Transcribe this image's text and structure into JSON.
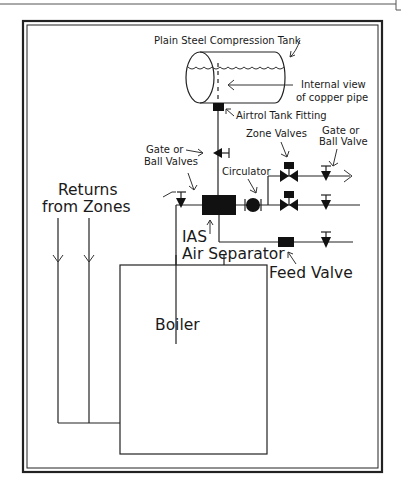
{
  "diagram": {
    "labels": {
      "tank": "Plain Steel Compression Tank",
      "internal_view_line1": "Internal view",
      "internal_view_line2": "of copper pipe",
      "airtrol": "Airtrol Tank Fitting",
      "zone_valves": "Zone Valves",
      "gate_ball_valve_line1": "Gate or",
      "gate_ball_valve_line2": "Ball Valve",
      "gate_ball_valves_line1": "Gate or",
      "gate_ball_valves_line2": "Ball Valves",
      "circulator": "Circulator",
      "returns_line1": "Returns",
      "returns_line2": "from Zones",
      "ias_line1": "IAS",
      "ias_line2": "Air Separator",
      "feed_valve": "Feed Valve",
      "boiler": "Boiler"
    },
    "colors": {
      "line": "#222222",
      "background": "#ffffff"
    }
  }
}
